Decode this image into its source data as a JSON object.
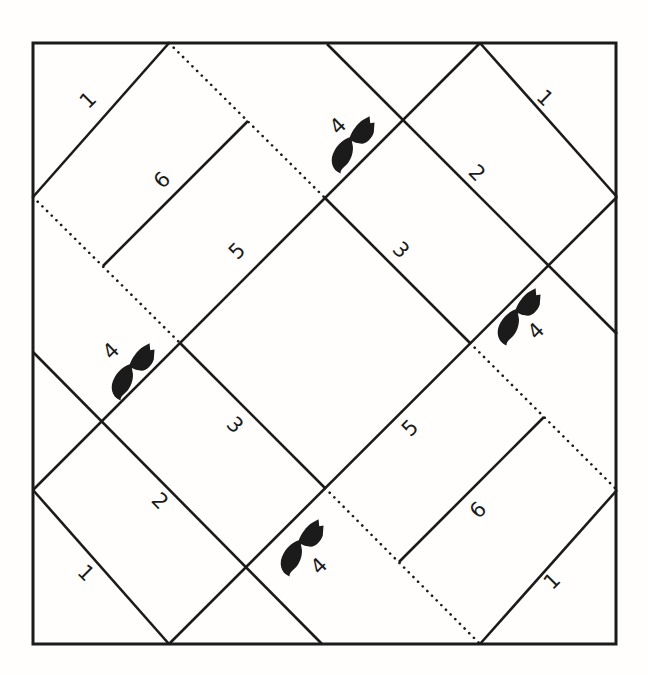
{
  "diagram": {
    "colors": {
      "ink": "#1b1b1b",
      "background": "#fffefd"
    },
    "border": {
      "x": 33,
      "y": 43,
      "width": 583,
      "height": 601,
      "stroke_width": 3
    },
    "line_style": {
      "solid_width": 2.6,
      "dotted_width": 2.6,
      "dot_gap": 6.5
    },
    "solid_lines": [
      {
        "name": "long-seam-nw-diagonal",
        "x1": 480,
        "y1": 43,
        "x2": 33,
        "y2": 490
      },
      {
        "name": "long-seam-se-diagonal",
        "x1": 617,
        "y1": 197,
        "x2": 169,
        "y2": 644
      },
      {
        "name": "long-seam-ne-diagonal",
        "x1": 327,
        "y1": 44,
        "x2": 617,
        "y2": 334
      },
      {
        "name": "long-seam-sw-diagonal",
        "x1": 33,
        "y1": 352,
        "x2": 322,
        "y2": 644
      },
      {
        "name": "center-diamond-ne-edge",
        "x1": 325,
        "y1": 198,
        "x2": 470,
        "y2": 343
      },
      {
        "name": "center-diamond-sw-edge",
        "x1": 180,
        "y1": 343,
        "x2": 325,
        "y2": 488
      },
      {
        "name": "corner-triangle-nw-hypotenuse",
        "x1": 169,
        "y1": 43,
        "x2": 33,
        "y2": 197
      },
      {
        "name": "corner-triangle-ne-hypotenuse",
        "x1": 480,
        "y1": 43,
        "x2": 617,
        "y2": 197
      },
      {
        "name": "corner-triangle-se-hypotenuse",
        "x1": 617,
        "y1": 490,
        "x2": 480,
        "y2": 644
      },
      {
        "name": "corner-triangle-sw-hypotenuse",
        "x1": 33,
        "y1": 490,
        "x2": 169,
        "y2": 644
      },
      {
        "name": "strip-seam-nw-band",
        "x1": 248,
        "y1": 121,
        "x2": 103,
        "y2": 266
      },
      {
        "name": "strip-seam-se-band",
        "x1": 544,
        "y1": 417,
        "x2": 399,
        "y2": 562
      }
    ],
    "dotted_lines": [
      {
        "name": "fold-line-top",
        "x1": 169,
        "y1": 43,
        "x2": 325,
        "y2": 198
      },
      {
        "name": "fold-line-right",
        "x1": 470,
        "y1": 343,
        "x2": 617,
        "y2": 490
      },
      {
        "name": "fold-line-left",
        "x1": 33,
        "y1": 197,
        "x2": 180,
        "y2": 343
      },
      {
        "name": "fold-line-bottom",
        "x1": 325,
        "y1": 488,
        "x2": 480,
        "y2": 644
      }
    ],
    "piece_labels": [
      {
        "text": "1",
        "x": 88,
        "y": 100,
        "rot": -45,
        "arm": "nw-corner"
      },
      {
        "text": "6",
        "x": 162,
        "y": 180,
        "rot": -45,
        "arm": "nw-strip"
      },
      {
        "text": "5",
        "x": 237,
        "y": 251,
        "rot": -45,
        "arm": "nw-strip"
      },
      {
        "text": "1",
        "x": 545,
        "y": 98,
        "rot": 45,
        "arm": "ne-corner"
      },
      {
        "text": "2",
        "x": 477,
        "y": 173,
        "rot": 45,
        "arm": "ne-strip"
      },
      {
        "text": "3",
        "x": 401,
        "y": 250,
        "rot": 45,
        "arm": "ne-strip"
      },
      {
        "text": "5",
        "x": 410,
        "y": 428,
        "rot": -45,
        "arm": "se-strip"
      },
      {
        "text": "6",
        "x": 478,
        "y": 510,
        "rot": -45,
        "arm": "se-strip"
      },
      {
        "text": "1",
        "x": 552,
        "y": 581,
        "rot": -45,
        "arm": "se-corner"
      },
      {
        "text": "3",
        "x": 235,
        "y": 425,
        "rot": 45,
        "arm": "sw-strip"
      },
      {
        "text": "2",
        "x": 160,
        "y": 501,
        "rot": 45,
        "arm": "sw-strip"
      },
      {
        "text": "1",
        "x": 86,
        "y": 573,
        "rot": 45,
        "arm": "sw-corner"
      }
    ],
    "markers": [
      {
        "glyph": "bat-silhouette",
        "x": 354,
        "y": 143,
        "rot": -45,
        "label": "4",
        "label_x": 338,
        "label_y": 126,
        "label_rot": -45,
        "position": "top"
      },
      {
        "glyph": "bat-silhouette",
        "x": 134,
        "y": 370,
        "rot": -45,
        "label": "4",
        "label_x": 111,
        "label_y": 351,
        "label_rot": -45,
        "position": "left"
      },
      {
        "glyph": "bat-silhouette",
        "x": 520,
        "y": 315,
        "rot": -45,
        "label": "4",
        "label_x": 536,
        "label_y": 331,
        "label_rot": -45,
        "position": "right"
      },
      {
        "glyph": "bat-silhouette",
        "x": 303,
        "y": 546,
        "rot": -45,
        "label": "4",
        "label_x": 319,
        "label_y": 566,
        "label_rot": -45,
        "position": "bottom"
      }
    ]
  }
}
